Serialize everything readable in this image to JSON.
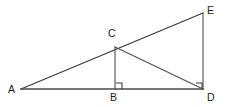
{
  "figure": {
    "background_color": "#ffffff",
    "line_color": "#3b3b3b",
    "label_color": "#1d1d1d",
    "width": 225,
    "height": 107,
    "vertices": [
      {
        "name": "A",
        "label": "A",
        "x": 21,
        "y": 89,
        "label_x": 8,
        "label_y": 84
      },
      {
        "name": "B",
        "label": "B",
        "x": 115,
        "y": 89,
        "label_x": 110,
        "label_y": 92
      },
      {
        "name": "C",
        "label": "C",
        "x": 115,
        "y": 47,
        "label_x": 108,
        "label_y": 28
      },
      {
        "name": "D",
        "label": "D",
        "x": 203,
        "y": 89,
        "label_x": 207,
        "label_y": 92
      },
      {
        "name": "E",
        "label": "E",
        "x": 203,
        "y": 13,
        "label_x": 207,
        "label_y": 5
      }
    ],
    "segments": [
      {
        "name": "segment-AE",
        "from": "A",
        "to": "E",
        "x1": 21,
        "y1": 89,
        "x2": 203,
        "y2": 13
      },
      {
        "name": "segment-AD",
        "from": "A",
        "to": "D",
        "x1": 21,
        "y1": 89,
        "x2": 203,
        "y2": 89
      },
      {
        "name": "segment-CB",
        "from": "C",
        "to": "B",
        "x1": 115,
        "y1": 47,
        "x2": 115,
        "y2": 89
      },
      {
        "name": "segment-CD",
        "from": "C",
        "to": "D",
        "x1": 115,
        "y1": 47,
        "x2": 203,
        "y2": 89
      },
      {
        "name": "segment-ED",
        "from": "E",
        "to": "D",
        "x1": 203,
        "y1": 13,
        "x2": 203,
        "y2": 89
      }
    ],
    "right_angle_marks": [
      {
        "name": "right-angle-at-B",
        "at": "B",
        "path": "M 116 83 L 122 83 L 122 89"
      },
      {
        "name": "right-angle-at-D",
        "at": "D",
        "path": "M 196 83 L 202 83 L 202 89"
      }
    ]
  }
}
